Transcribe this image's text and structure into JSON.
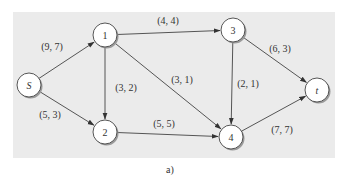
{
  "diagram": {
    "type": "flow-network",
    "caption": "a)",
    "colors": {
      "background_panel": "#ebebeb",
      "edge": "#555555",
      "node_fill": "#ffffff",
      "node_stroke": "#444444",
      "node_shadow": "#9a9a9a",
      "text": "#333333"
    },
    "nodes": [
      {
        "id": "S",
        "label": "S",
        "italic": true,
        "x": 29,
        "y": 85
      },
      {
        "id": "1",
        "label": "1",
        "italic": false,
        "x": 105,
        "y": 35
      },
      {
        "id": "2",
        "label": "2",
        "italic": false,
        "x": 105,
        "y": 132
      },
      {
        "id": "3",
        "label": "3",
        "italic": false,
        "x": 233,
        "y": 30
      },
      {
        "id": "4",
        "label": "4",
        "italic": false,
        "x": 231,
        "y": 137
      },
      {
        "id": "t",
        "label": "t",
        "italic": true,
        "x": 317,
        "y": 90
      }
    ],
    "edges": [
      {
        "from": "S",
        "to": "1",
        "label": "(9, 7)",
        "lx": 52,
        "ly": 50
      },
      {
        "from": "S",
        "to": "2",
        "label": "(5, 3)",
        "lx": 50,
        "ly": 118
      },
      {
        "from": "1",
        "to": "3",
        "label": "(4, 4)",
        "lx": 168,
        "ly": 24
      },
      {
        "from": "1",
        "to": "2",
        "label": "(3, 2)",
        "lx": 126,
        "ly": 91
      },
      {
        "from": "1",
        "to": "4",
        "label": "(3, 1)",
        "lx": 182,
        "ly": 83
      },
      {
        "from": "2",
        "to": "4",
        "label": "(5, 5)",
        "lx": 164,
        "ly": 127
      },
      {
        "from": "3",
        "to": "4",
        "label": "(2, 1)",
        "lx": 248,
        "ly": 87
      },
      {
        "from": "3",
        "to": "t",
        "label": "(6, 3)",
        "lx": 280,
        "ly": 52
      },
      {
        "from": "4",
        "to": "t",
        "label": "(7, 7)",
        "lx": 282,
        "ly": 133
      }
    ]
  }
}
